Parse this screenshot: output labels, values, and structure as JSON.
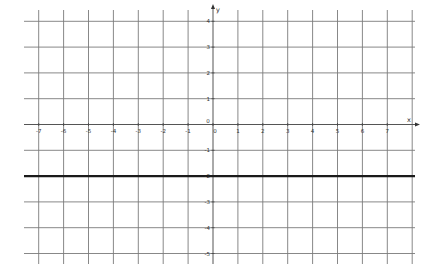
{
  "chart_data": {
    "type": "line",
    "title": "",
    "xlabel": "x",
    "ylabel": "y",
    "xlim": [
      -7.7,
      8.0
    ],
    "ylim": [
      -5.5,
      4.5
    ],
    "grid": true,
    "x_ticks": [
      -7,
      -6,
      -5,
      -4,
      -3,
      -2,
      -1,
      0,
      1,
      2,
      3,
      4,
      5,
      6,
      7
    ],
    "y_ticks": [
      4,
      3,
      2,
      1,
      0,
      -1,
      -2,
      -3,
      -4,
      -5
    ],
    "x_tick_labels": [
      "-7",
      "-6",
      "-5",
      "-4",
      "-3",
      "-2",
      "-1",
      "0",
      "1",
      "2",
      "3",
      "4",
      "5",
      "6",
      "7"
    ],
    "y_tick_labels": [
      "4",
      "3",
      "2",
      "1",
      "0",
      "-1",
      "-2",
      "-3",
      "-4",
      "-5"
    ],
    "series": [
      {
        "name": "y = -2",
        "equation": "y = -2",
        "x": [
          -7.7,
          8.0
        ],
        "y": [
          -2,
          -2
        ],
        "color": "#1a1a1a"
      }
    ],
    "colors": {
      "grid": "#7a7a7a",
      "axis": "#555555",
      "line": "#1a1a1a"
    }
  }
}
